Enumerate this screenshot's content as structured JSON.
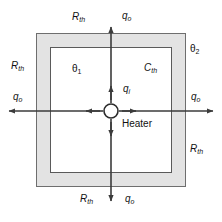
{
  "figure": {
    "kind": "thermal-network-diagram",
    "colors": {
      "line": "#3b3b3b",
      "wall_fill": "#e3e3e3",
      "inner_fill": "#ffffff",
      "text": "#111111",
      "background": "#ffffff"
    }
  },
  "labels": {
    "top_resistance": {
      "symbol": "R",
      "sub": "th"
    },
    "top_flow": {
      "symbol": "q",
      "sub": "o"
    },
    "left_resistance": {
      "symbol": "R",
      "sub": "th"
    },
    "left_flow": {
      "symbol": "q",
      "sub": "o"
    },
    "right_flow": {
      "symbol": "q",
      "sub": "o"
    },
    "right_resistance": {
      "symbol": "R",
      "sub": "th"
    },
    "bottom_resistance": {
      "symbol": "R",
      "sub": "th"
    },
    "bottom_flow": {
      "symbol": "q",
      "sub": "o"
    },
    "outer_temperature": {
      "symbol": "θ",
      "sub": "2"
    },
    "inner_temperature": {
      "symbol": "θ",
      "sub": "1"
    },
    "thermal_capacitance": {
      "symbol": "C",
      "sub": "th"
    },
    "input_flow": {
      "symbol": "q",
      "sub": "i"
    },
    "heater": {
      "text": "Heater"
    }
  },
  "geometry": {
    "outer_box": {
      "x": 36,
      "y": 33,
      "width": 150,
      "height": 154
    },
    "inner_box": {
      "x": 50,
      "y": 47,
      "width": 122,
      "height": 126
    },
    "heater_circle": {
      "cx": 111,
      "cy": 111,
      "r": 7
    }
  }
}
